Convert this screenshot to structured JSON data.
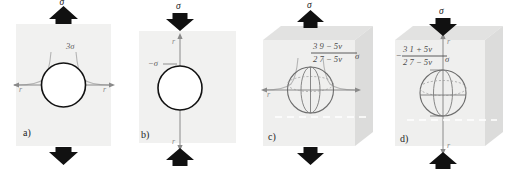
{
  "figure": {
    "background_color": "#ffffff",
    "plate_fill": "#f1f1f0",
    "arrow_color": "#111111",
    "curve_color": "#b4b4b4",
    "axis_color": "#8a8a8a"
  },
  "panels": [
    {
      "id": "a",
      "label": "a)",
      "geometry": "2d-plate-with-circular-hole",
      "top_load_label": "σ",
      "top_arrow_direction": "up",
      "bottom_arrow_direction": "down",
      "loading": "tension",
      "axis_label_left": "r",
      "axis_label_right": "r",
      "axis_orientation": "horizontal",
      "peak_stress_label": "3σ",
      "has_stress_curve": true,
      "has_white_dashed_line": false
    },
    {
      "id": "b",
      "label": "b)",
      "geometry": "2d-plate-with-circular-hole",
      "top_load_label": "σ",
      "top_arrow_direction": "down",
      "bottom_arrow_direction": "up",
      "loading": "compression",
      "axis_label_top": "r",
      "axis_label_bottom": "r",
      "axis_orientation": "vertical",
      "peak_stress_label": "−σ",
      "has_stress_curve": false,
      "has_white_dashed_line": false
    },
    {
      "id": "c",
      "label": "c)",
      "geometry": "3d-cube-with-spherical-cavity",
      "top_load_label": "σ",
      "top_arrow_direction": "up",
      "bottom_arrow_direction": "down",
      "loading": "tension",
      "axis_label_left": "r",
      "axis_label_right": "r",
      "axis_orientation": "horizontal",
      "has_stress_curve": true,
      "has_white_dashed_line": true,
      "formula": {
        "sign": "",
        "numerator": "3 9 − 5ν",
        "denominator": "2 7 − 5ν",
        "multiplier": "σ"
      }
    },
    {
      "id": "d",
      "label": "d)",
      "geometry": "3d-cube-with-spherical-cavity",
      "top_load_label": "σ",
      "top_arrow_direction": "down",
      "bottom_arrow_direction": "up",
      "loading": "compression",
      "axis_label_top": "r",
      "axis_label_bottom": "r",
      "axis_orientation": "vertical",
      "has_stress_curve": false,
      "has_white_dashed_line": true,
      "formula": {
        "sign": "−",
        "numerator": "3 1 + 5ν",
        "denominator": "2 7 − 5ν",
        "multiplier": "σ"
      }
    }
  ]
}
